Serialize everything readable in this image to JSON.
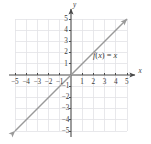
{
  "chart_data": {
    "type": "line",
    "title": "",
    "xlabel": "x",
    "ylabel": "y",
    "xlim": [
      -5.5,
      5.5
    ],
    "ylim": [
      -5.5,
      5.5
    ],
    "grid": true,
    "grid_range": [
      -5,
      5
    ],
    "legend": "none",
    "x_ticks": [
      -5,
      -4,
      -3,
      -2,
      -1,
      1,
      2,
      3,
      4,
      5
    ],
    "y_ticks": [
      5,
      4,
      3,
      2,
      1,
      -1,
      -2,
      -3,
      -4,
      -5
    ],
    "x_tick_labels": [
      "−5",
      "−4",
      "−3",
      "−2",
      "−1",
      "1",
      "2",
      "3",
      "4",
      "5"
    ],
    "y_tick_labels": [
      "5",
      "4",
      "3",
      "2",
      "1",
      "−1",
      "−2",
      "−3",
      "−4",
      "−5"
    ],
    "series": [
      {
        "name": "f(x) = x",
        "equation": "f(x) = x",
        "slope": 1,
        "intercept": 0,
        "x": [
          -5.5,
          5.5
        ],
        "values": [
          -5.5,
          5.5
        ],
        "arrows": "both",
        "color": "#9a9a9a"
      }
    ],
    "annotations": [
      {
        "text": "f(x) = x",
        "x": 2.0,
        "y": 1.65
      }
    ],
    "colors": {
      "axis": "#4a4a4a",
      "grid": "#e2e2e6",
      "line": "#9a9a9a",
      "text": "#3a3a3a",
      "background": "#ffffff"
    }
  },
  "axes": {
    "x_axis_label": "x",
    "y_axis_label": "y",
    "x_labels": [
      {
        "text": "−5",
        "x": 15.5,
        "y": 78.5
      },
      {
        "text": "−4",
        "x": 27.0,
        "y": 78.5
      },
      {
        "text": "−3",
        "x": 38.5,
        "y": 78.5
      },
      {
        "text": "−2",
        "x": 49.8,
        "y": 78.5
      },
      {
        "text": "−1",
        "x": 61.0,
        "y": 78.5
      },
      {
        "text": "1",
        "x": 80.0,
        "y": 78.5
      },
      {
        "text": "2",
        "x": 91.2,
        "y": 78.5
      },
      {
        "text": "3",
        "x": 102.4,
        "y": 78.5
      },
      {
        "text": "4",
        "x": 113.6,
        "y": 78.5
      },
      {
        "text": "5",
        "x": 124.8,
        "y": 78.5
      }
    ],
    "y_labels": [
      {
        "text": "5",
        "x": 64.0,
        "y": 16.5
      },
      {
        "text": "4",
        "x": 64.0,
        "y": 27.8
      },
      {
        "text": "3",
        "x": 64.0,
        "y": 39.0
      },
      {
        "text": "2",
        "x": 64.0,
        "y": 50.2
      },
      {
        "text": "1",
        "x": 64.0,
        "y": 61.4
      },
      {
        "text": "−1",
        "x": 61.5,
        "y": 84.0
      },
      {
        "text": "−2",
        "x": 61.5,
        "y": 95.2
      },
      {
        "text": "−3",
        "x": 61.5,
        "y": 106.4
      },
      {
        "text": "−4",
        "x": 61.5,
        "y": 117.6
      },
      {
        "text": "−5",
        "x": 61.5,
        "y": 128.8
      }
    ]
  }
}
